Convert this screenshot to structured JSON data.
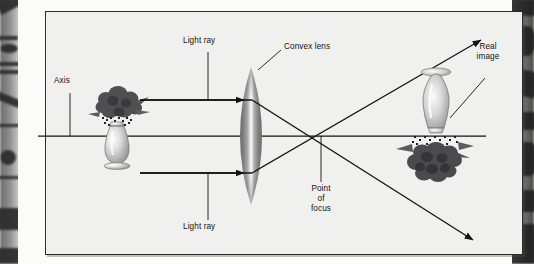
{
  "figure": {
    "kind": "optics-ray-diagram",
    "title_in_image": "",
    "background_color": "#f0f0ee",
    "ink_color": "#131313",
    "labels": {
      "axis": "Axis",
      "light_ray_top": "Light ray",
      "light_ray_bottom": "Light ray",
      "convex_lens": "Convex lens",
      "real_image_line1": "Real",
      "real_image_line2": "image",
      "point_of_focus_line1": "Point",
      "point_of_focus_line2": "of",
      "point_of_focus_line3": "focus"
    },
    "objects": {
      "object_name": "vase-of-flowers-upright",
      "image_name": "vase-of-flowers-inverted",
      "lens_name": "biconvex-lens"
    },
    "geometry": {
      "optical_axis_y": 136,
      "focus_point_x": 303,
      "focus_point_y": 136,
      "lens_center_x": 233,
      "top_ray_y": 100,
      "bottom_ray_y": 173
    }
  }
}
